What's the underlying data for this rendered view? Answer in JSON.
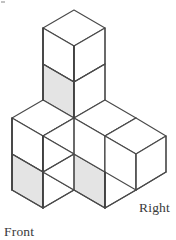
{
  "figure": {
    "kind": "isometric-block-drawing",
    "background_color": "#ffffff",
    "edge_color": "#4a4a4a",
    "shaded_face_color": "#e4e4e4",
    "unshaded_face_color": "#ffffff",
    "cube_count": 7,
    "labels": {
      "front": "Front",
      "right": "Right"
    },
    "label_positions": {
      "front": {
        "x": 4,
        "y": 236
      },
      "right": {
        "x": 139,
        "y": 212
      }
    },
    "projection": {
      "type": "isometric",
      "half_width": 31,
      "half_height": 18,
      "cube_height": 36,
      "origin": {
        "x": 74,
        "y": 64
      }
    },
    "cubes": [
      {
        "id": "top-tower-upper",
        "grid": [
          0,
          0,
          2
        ],
        "top_face": "white",
        "left_face": "white",
        "right_face": "white"
      },
      {
        "id": "top-tower-lower",
        "grid": [
          0,
          0,
          1
        ],
        "top_face": "white",
        "left_face": "gray",
        "right_face": "white"
      },
      {
        "id": "center-base",
        "grid": [
          0,
          0,
          0
        ],
        "top_face": "white",
        "left_face": "white",
        "right_face": "white"
      },
      {
        "id": "left-upper",
        "grid": [
          1,
          0,
          1
        ],
        "top_face": "white",
        "left_face": "white",
        "right_face": "white"
      },
      {
        "id": "left-lower",
        "grid": [
          1,
          0,
          0
        ],
        "top_face": "white",
        "left_face": "gray",
        "right_face": "white"
      },
      {
        "id": "front-center",
        "grid": [
          1,
          1,
          0
        ],
        "top_face": "white",
        "left_face": "gray",
        "right_face": "white"
      },
      {
        "id": "right-inner",
        "grid": [
          0,
          1,
          0
        ],
        "top_face": "white",
        "left_face": "white",
        "right_face": "white"
      },
      {
        "id": "right-outer",
        "grid": [
          0,
          2,
          0
        ],
        "top_face": "white",
        "left_face": "white",
        "right_face": "white"
      }
    ],
    "shaded_faces_note": "Left (south-west) faces of the lower tower cube, the left column lower cube, and the front-center cube are shaded light gray."
  }
}
